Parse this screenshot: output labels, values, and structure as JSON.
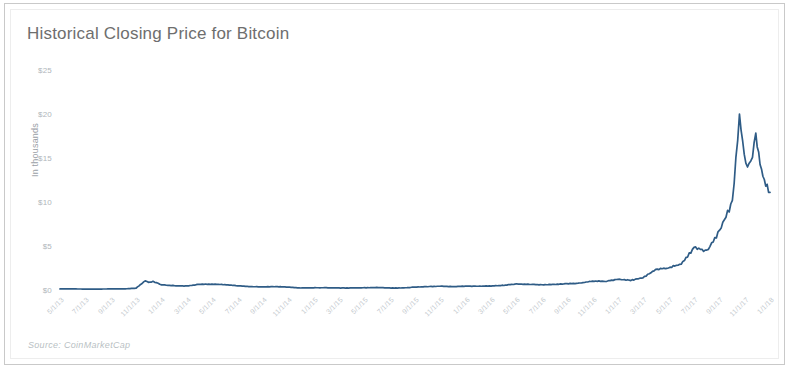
{
  "chart_data": {
    "type": "line",
    "title": "Historical Closing Price for Bitcoin",
    "source": "Source: CoinMarketCap",
    "xlabel": "",
    "ylabel": "In thousands",
    "grid": false,
    "legend": "none",
    "line_color": "#2f5c86",
    "ylim": [
      0,
      25
    ],
    "ytick_labels": [
      "$0",
      "$5",
      "$10",
      "$15",
      "$20",
      "$25"
    ],
    "ytick_values": [
      0,
      5,
      10,
      15,
      20,
      25
    ],
    "xtick_labels": [
      "5/1/13",
      "7/1/13",
      "9/1/13",
      "11/1/13",
      "1/1/14",
      "3/1/14",
      "5/1/14",
      "7/1/14",
      "9/1/14",
      "11/1/14",
      "1/1/15",
      "3/1/15",
      "5/1/15",
      "7/1/15",
      "9/1/15",
      "11/1/15",
      "1/1/16",
      "3/1/16",
      "5/1/16",
      "7/1/16",
      "9/1/16",
      "11/1/16",
      "1/1/17",
      "3/1/17",
      "5/1/17",
      "7/1/17",
      "9/1/17",
      "11/1/17",
      "1/1/18"
    ],
    "x": [
      "5/1/13",
      "6/1/13",
      "7/1/13",
      "8/1/13",
      "9/1/13",
      "10/1/13",
      "11/1/13",
      "12/1/13",
      "1/1/14",
      "2/1/14",
      "3/1/14",
      "4/1/14",
      "5/1/14",
      "6/1/14",
      "7/1/14",
      "8/1/14",
      "9/1/14",
      "10/1/14",
      "11/1/14",
      "12/1/14",
      "1/1/15",
      "2/1/15",
      "3/1/15",
      "4/1/15",
      "5/1/15",
      "6/1/15",
      "7/1/15",
      "8/1/15",
      "9/1/15",
      "10/1/15",
      "11/1/15",
      "12/1/15",
      "1/1/16",
      "2/1/16",
      "3/1/16",
      "4/1/16",
      "5/1/16",
      "6/1/16",
      "7/1/16",
      "8/1/16",
      "9/1/16",
      "10/1/16",
      "11/1/16",
      "12/1/16",
      "1/1/17",
      "2/1/17",
      "3/1/17",
      "4/1/17",
      "5/1/17",
      "6/1/17",
      "7/1/17",
      "8/1/17",
      "9/1/17",
      "10/1/17",
      "11/1/17",
      "12/1/17",
      "12/17/17",
      "12/22/17",
      "1/1/18",
      "1/7/18",
      "1/16/18",
      "1/20/18",
      "1/31/18"
    ],
    "values": [
      0.117,
      0.122,
      0.092,
      0.106,
      0.128,
      0.135,
      0.205,
      1.035,
      0.826,
      0.945,
      0.565,
      0.462,
      0.452,
      0.629,
      0.641,
      0.595,
      0.478,
      0.387,
      0.338,
      0.378,
      0.315,
      0.228,
      0.254,
      0.247,
      0.235,
      0.223,
      0.261,
      0.285,
      0.23,
      0.236,
      0.336,
      0.363,
      0.434,
      0.373,
      0.418,
      0.416,
      0.449,
      0.53,
      0.673,
      0.625,
      0.575,
      0.614,
      0.71,
      0.745,
      0.963,
      0.97,
      1.19,
      1.08,
      1.35,
      2.3,
      2.48,
      2.87,
      4.7,
      4.34,
      6.47,
      9.9,
      19.5,
      13.8,
      14.1,
      17.2,
      13.6,
      11.6,
      11.1
    ],
    "series_points_normalized": [
      [
        0.0,
        0.005
      ],
      [
        0.018,
        0.005
      ],
      [
        0.036,
        0.004
      ],
      [
        0.054,
        0.004
      ],
      [
        0.072,
        0.005
      ],
      [
        0.09,
        0.005
      ],
      [
        0.107,
        0.008
      ],
      [
        0.12,
        0.041
      ],
      [
        0.125,
        0.033
      ],
      [
        0.131,
        0.038
      ],
      [
        0.143,
        0.023
      ],
      [
        0.161,
        0.019
      ],
      [
        0.179,
        0.018
      ],
      [
        0.196,
        0.025
      ],
      [
        0.214,
        0.026
      ],
      [
        0.232,
        0.024
      ],
      [
        0.25,
        0.019
      ],
      [
        0.268,
        0.015
      ],
      [
        0.286,
        0.014
      ],
      [
        0.304,
        0.015
      ],
      [
        0.321,
        0.013
      ],
      [
        0.339,
        0.009
      ],
      [
        0.357,
        0.01
      ],
      [
        0.375,
        0.01
      ],
      [
        0.393,
        0.009
      ],
      [
        0.411,
        0.009
      ],
      [
        0.429,
        0.01
      ],
      [
        0.446,
        0.011
      ],
      [
        0.464,
        0.009
      ],
      [
        0.482,
        0.009
      ],
      [
        0.5,
        0.013
      ],
      [
        0.518,
        0.015
      ],
      [
        0.536,
        0.017
      ],
      [
        0.554,
        0.015
      ],
      [
        0.571,
        0.017
      ],
      [
        0.589,
        0.017
      ],
      [
        0.607,
        0.018
      ],
      [
        0.625,
        0.021
      ],
      [
        0.643,
        0.027
      ],
      [
        0.661,
        0.025
      ],
      [
        0.679,
        0.023
      ],
      [
        0.696,
        0.025
      ],
      [
        0.714,
        0.028
      ],
      [
        0.732,
        0.03
      ],
      [
        0.75,
        0.039
      ],
      [
        0.768,
        0.039
      ],
      [
        0.786,
        0.048
      ],
      [
        0.804,
        0.043
      ],
      [
        0.821,
        0.054
      ],
      [
        0.839,
        0.092
      ],
      [
        0.857,
        0.099
      ],
      [
        0.875,
        0.115
      ],
      [
        0.893,
        0.188
      ],
      [
        0.911,
        0.174
      ],
      [
        0.929,
        0.259
      ],
      [
        0.947,
        0.396
      ],
      [
        0.957,
        0.78
      ],
      [
        0.966,
        0.552
      ],
      [
        0.973,
        0.564
      ],
      [
        0.98,
        0.688
      ],
      [
        0.988,
        0.544
      ],
      [
        0.994,
        0.464
      ],
      [
        1.0,
        0.444
      ]
    ]
  },
  "chart": {
    "title": "Historical Closing Price for Bitcoin",
    "source": "Source: CoinMarketCap",
    "y_axis_title": "In thousands"
  }
}
